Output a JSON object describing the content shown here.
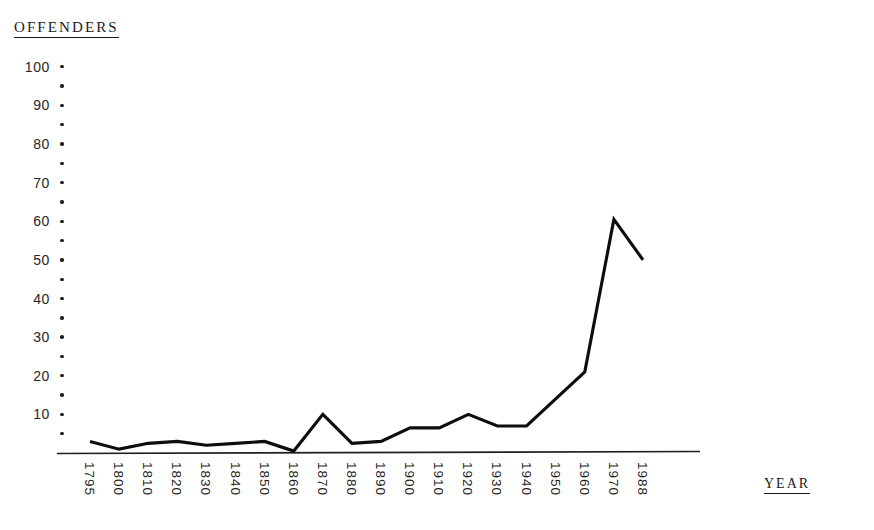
{
  "chart_data": {
    "type": "line",
    "title": "",
    "ylabel": "OFFENDERS",
    "xlabel": "YEAR",
    "grid": false,
    "legend": "none",
    "ylim": [
      0,
      100
    ],
    "y_ticks_labeled": [
      100,
      90,
      80,
      70,
      60,
      50,
      40,
      30,
      20,
      10
    ],
    "y_tick_interval_minor": 5,
    "categories": [
      "1795",
      "1800",
      "1810",
      "1820",
      "1830",
      "1840",
      "1850",
      "1860",
      "1870",
      "1880",
      "1890",
      "1900",
      "1910",
      "1920",
      "1930",
      "1940",
      "1950",
      "1960",
      "1970",
      "1988"
    ],
    "values": [
      3,
      1,
      2.5,
      3,
      2,
      2.5,
      3,
      0.5,
      10,
      2.5,
      3,
      6.5,
      6.5,
      10,
      7,
      7,
      14,
      21,
      60.5,
      50
    ]
  },
  "axes": {
    "y_title": "OFFENDERS",
    "x_title": "YEAR"
  }
}
